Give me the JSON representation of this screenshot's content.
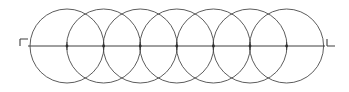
{
  "figure": {
    "caption": "",
    "background_color": "#ffffff",
    "stroke_color": "#4a4a4a",
    "axis_color": "#3f3f3f",
    "marker_color": "#3f3f3f",
    "width": 349,
    "height": 92
  },
  "chart_data": {
    "type": "scatter",
    "subtitle": "",
    "xlabel": "",
    "ylabel": "",
    "xlim": [
      0,
      349
    ],
    "ylim": [
      0,
      92
    ],
    "grid": false,
    "legend": null,
    "series": [
      {
        "name": "circle-centers",
        "marker": "dot",
        "x": [
          67.0,
          103.6,
          140.2,
          176.8,
          213.4,
          250.0,
          286.6
        ],
        "y": [
          46,
          46,
          46,
          46,
          46,
          46,
          46
        ]
      }
    ],
    "annotations": [
      {
        "name": "left-end-bracket",
        "glyph": "¬",
        "x": 20,
        "y": 46
      },
      {
        "name": "right-end-bracket",
        "glyph": "L",
        "x": 327,
        "y": 46
      }
    ]
  },
  "geometry": {
    "circle_count": 7,
    "circle_radius": 37,
    "circle_center_y": 46,
    "circle_center_spacing": 36.6,
    "circle_center_x": [
      67.0,
      103.6,
      140.2,
      176.8,
      213.4,
      250.0,
      286.6
    ],
    "circle_top_y": 9,
    "circle_bottom_y": 83,
    "axis_y": 46,
    "axis_x_start": 28,
    "axis_x_end": 325,
    "center_tick_half_height": 4,
    "center_dot_radius": 1.4
  },
  "markers": {
    "left": {
      "label": "left-corner-bracket",
      "x": 20,
      "y": 46,
      "arm_length": 8,
      "stem_length": 7,
      "orientation": "top-right-corner-opening-down-left"
    },
    "right": {
      "label": "right-corner-bracket",
      "x": 327,
      "y": 46,
      "arm_length": 8,
      "stem_length": 7,
      "orientation": "bottom-left-corner-opening-up-right"
    }
  }
}
